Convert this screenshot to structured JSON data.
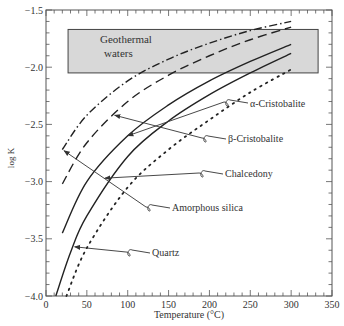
{
  "chart_data": {
    "type": "line",
    "title": "",
    "xlabel": "Temperature (°C)",
    "ylabel": "log K",
    "xlim": [
      0,
      350
    ],
    "ylim": [
      -4.0,
      -1.5
    ],
    "xticks": [
      0,
      50,
      100,
      150,
      200,
      250,
      300,
      350
    ],
    "yticks": [
      -1.5,
      -2.0,
      -2.5,
      -3.0,
      -3.5,
      -4.0
    ],
    "xtick_labels": [
      "0",
      "50",
      "100",
      "150",
      "200",
      "250",
      "300",
      "350"
    ],
    "ytick_labels": [
      "−1.5",
      "−2.0",
      "−2.5",
      "−3.0",
      "−3.5",
      "−4.0"
    ],
    "grid": false,
    "legend": "none (inline annotations with arrows)",
    "series": [
      {
        "name": "Amorphous silica",
        "style": "dash-dot",
        "x": [
          20,
          50,
          100,
          150,
          200,
          250,
          300
        ],
        "y": [
          -2.72,
          -2.42,
          -2.12,
          -1.93,
          -1.79,
          -1.68,
          -1.6
        ]
      },
      {
        "name": "β-Cristobalite",
        "style": "dashed",
        "x": [
          20,
          50,
          100,
          150,
          200,
          250,
          300
        ],
        "y": [
          -3.02,
          -2.66,
          -2.3,
          -2.07,
          -1.9,
          -1.76,
          -1.65
        ]
      },
      {
        "name": "α-Cristobalite",
        "style": "solid",
        "x": [
          20,
          50,
          100,
          150,
          200,
          250,
          300
        ],
        "y": [
          -3.45,
          -3.0,
          -2.6,
          -2.33,
          -2.12,
          -1.95,
          -1.8
        ]
      },
      {
        "name": "Chalcedony",
        "style": "solid",
        "x": [
          12,
          30,
          50,
          100,
          150,
          200,
          250,
          300
        ],
        "y": [
          -4.0,
          -3.62,
          -3.3,
          -2.78,
          -2.47,
          -2.24,
          -2.05,
          -1.88
        ]
      },
      {
        "name": "Quartz",
        "style": "dotted",
        "x": [
          25,
          50,
          100,
          150,
          200,
          250,
          300
        ],
        "y": [
          -4.0,
          -3.58,
          -3.05,
          -2.72,
          -2.46,
          -2.22,
          -2.02
        ]
      }
    ],
    "annotations": [
      {
        "text": "Geothermal waters",
        "type": "shaded-box",
        "x_range": [
          27,
          333
        ],
        "y_range": [
          -2.05,
          -1.67
        ]
      },
      {
        "text": "α-Cristobalite",
        "arrow_to": [
          100,
          -2.6
        ]
      },
      {
        "text": "β-Cristobalite",
        "arrow_to": [
          84,
          -2.42
        ]
      },
      {
        "text": "Chalcedony",
        "arrow_to": [
          72,
          -2.97
        ]
      },
      {
        "text": "Amorphous silica",
        "arrow_to": [
          22,
          -2.73
        ]
      },
      {
        "text": "Quartz",
        "arrow_to": [
          35,
          -3.57
        ]
      }
    ]
  },
  "labels": {
    "box_line1": "Geothermal",
    "box_line2": "waters",
    "alpha": "α-Cristobalite",
    "beta": "β-Cristobalite",
    "chalcedony": "Chalcedony",
    "amorphous": "Amorphous silica",
    "quartz": "Quartz",
    "xlabel": "Temperature (°C)",
    "ylabel": "log K"
  },
  "colors": {
    "box_fill": "#d8d8d8",
    "line": "#222222",
    "axis": "#555555"
  }
}
